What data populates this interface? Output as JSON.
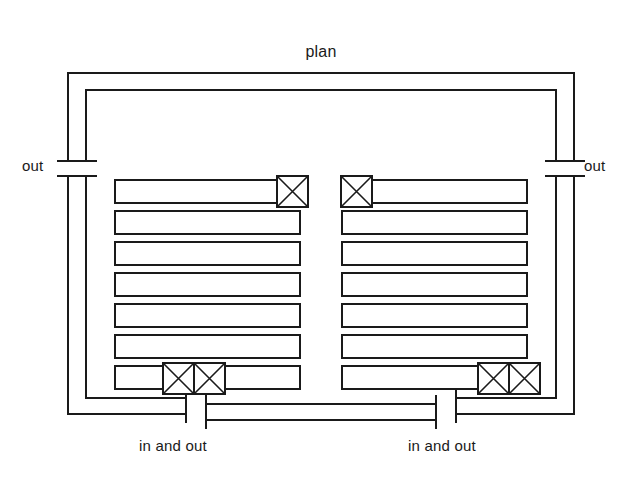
{
  "diagram": {
    "title": "plan",
    "type": "piping-plan",
    "labels": {
      "out_left": "out",
      "out_right": "out",
      "in_and_out_left": "in and out",
      "in_and_out_right": "in and out"
    },
    "colors": {
      "stroke": "#1a1a1a",
      "background": "#ffffff"
    },
    "banks": [
      {
        "side": "left",
        "row_count": 7,
        "valve_boxes": [
          {
            "row": 1,
            "position": "right-end",
            "count": 1
          },
          {
            "row": 7,
            "position": "left-inner",
            "count": 2
          }
        ]
      },
      {
        "side": "right",
        "row_count": 7,
        "valve_boxes": [
          {
            "row": 1,
            "position": "left-end",
            "count": 1
          },
          {
            "row": 7,
            "position": "right-inner",
            "count": 2
          }
        ]
      }
    ],
    "connections": [
      {
        "name": "top-header-duct",
        "style": "double-wall"
      },
      {
        "name": "left-riser",
        "terminal": "out"
      },
      {
        "name": "right-riser",
        "terminal": "out"
      },
      {
        "name": "bottom-left-header",
        "terminal": "in and out"
      },
      {
        "name": "bottom-right-header",
        "terminal": "in and out"
      },
      {
        "name": "bottom-center-duct",
        "style": "double-wall"
      }
    ]
  }
}
